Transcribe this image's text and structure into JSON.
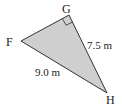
{
  "diagram": {
    "type": "right-triangle",
    "fill_color": "#cfcfcf",
    "stroke_color": "#333333",
    "vertices": {
      "F": {
        "label": "F",
        "x": 21,
        "y": 41
      },
      "G": {
        "label": "G",
        "x": 69,
        "y": 15
      },
      "H": {
        "label": "H",
        "x": 107,
        "y": 93
      }
    },
    "right_angle_at": "G",
    "sides": {
      "GH": {
        "label": "7.5 m"
      },
      "FH": {
        "label": "9.0 m"
      }
    }
  }
}
